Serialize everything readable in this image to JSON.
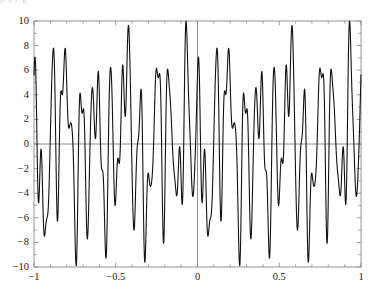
{
  "figure": {
    "name": "oscillatory-signal-plot",
    "top_remnant_text": "p         o            e       g",
    "background_color": "#ffffff",
    "curve_color": "#111111",
    "axis_color": "#6e6e6e",
    "frame_color": "#8a8a8a",
    "curve_width": 1.1
  },
  "chart_data": {
    "type": "line",
    "title": "",
    "subtitle": "",
    "xlabel": "",
    "ylabel": "",
    "xlim": [
      -1,
      1
    ],
    "ylim": [
      -10,
      10
    ],
    "grid": false,
    "legend": null,
    "x_ticks": [
      -1,
      -0.5,
      0,
      0.5,
      1
    ],
    "x_tick_labels": [
      "−1",
      "−0.5",
      "0",
      "0.5",
      "1"
    ],
    "y_ticks": [
      -10,
      -8,
      -6,
      -4,
      -2,
      0,
      2,
      4,
      6,
      8,
      10
    ],
    "y_tick_labels": [
      "−10",
      "−8",
      "−6",
      "−4",
      "−2",
      "0",
      "2",
      "4",
      "6",
      "8",
      "10"
    ],
    "x_minor_ticks": [
      -0.9,
      -0.8,
      -0.7,
      -0.6,
      -0.4,
      -0.3,
      -0.2,
      -0.1,
      0.1,
      0.2,
      0.3,
      0.4,
      0.6,
      0.7,
      0.8,
      0.9
    ],
    "y_minor_ticks": [
      -9,
      -7,
      -5,
      -3,
      -1,
      1,
      3,
      5,
      7,
      9
    ],
    "zero_lines": {
      "horizontal": 0,
      "vertical": 0
    },
    "series": [
      {
        "name": "sum-of-sinusoids",
        "description": "Dense multi-frequency oscillation, amplitude envelope approximately ±10",
        "model": "sum of sinusoidal components",
        "components": [
          {
            "amplitude": 4.0,
            "frequency_cycles_per_unit": 11.0,
            "phase_rad": 0.35
          },
          {
            "amplitude": 3.2,
            "frequency_cycles_per_unit": 17.0,
            "phase_rad": 1.85
          },
          {
            "amplitude": 2.6,
            "frequency_cycles_per_unit": 5.0,
            "phase_rad": 2.6
          },
          {
            "amplitude": 1.9,
            "frequency_cycles_per_unit": 26.0,
            "phase_rad": 0.7
          },
          {
            "amplitude": 1.2,
            "frequency_cycles_per_unit": 3.0,
            "phase_rad": 4.1
          },
          {
            "amplitude": 0.9,
            "frequency_cycles_per_unit": 34.0,
            "phase_rad": 5.2
          }
        ],
        "sample_count": 1600,
        "endpoint_values": {
          "at_x_minus1": 0.8,
          "at_x_plus1": -6.1
        },
        "observed_extrema": {
          "max_value": 10.0,
          "min_value": -9.9,
          "notable_peaks_x": [
            -0.82,
            -0.53,
            -0.22,
            0.06,
            0.35,
            0.64,
            0.88
          ],
          "notable_troughs_x": [
            -0.98,
            -0.63,
            -0.37,
            -0.09,
            0.19,
            0.47,
            0.75
          ]
        }
      }
    ]
  }
}
